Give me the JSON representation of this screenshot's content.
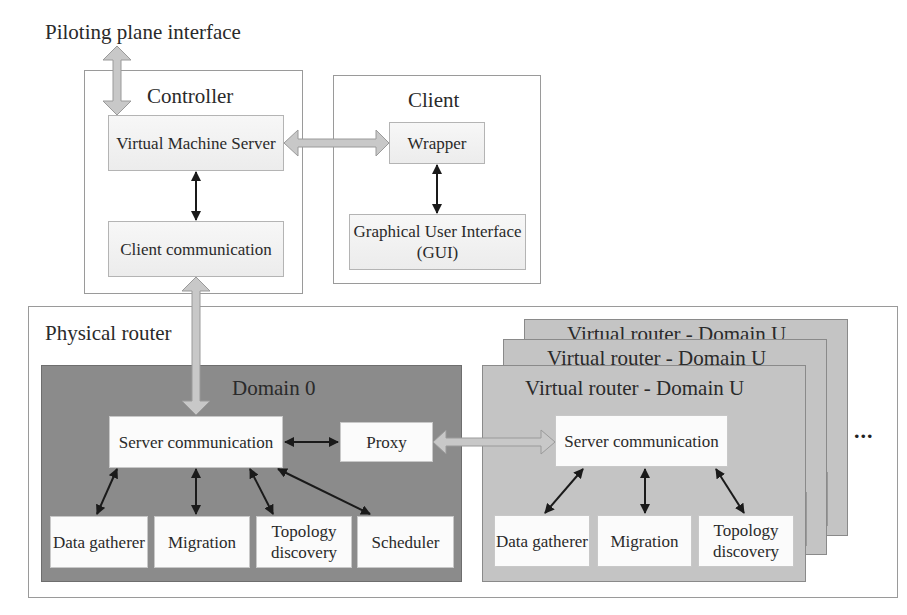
{
  "diagram": {
    "piloting_label": "Piloting plane interface",
    "controller": {
      "title": "Controller",
      "vm_server": "Virtual Machine Server",
      "client_comm": "Client communication"
    },
    "client": {
      "title": "Client",
      "wrapper": "Wrapper",
      "gui": "Graphical User Interface (GUI)"
    },
    "physical_router": {
      "title": "Physical router",
      "domain0": {
        "title": "Domain 0",
        "server_comm": "Server communication",
        "proxy": "Proxy",
        "modules": [
          "Data gatherer",
          "Migration",
          "Topology discovery",
          "Scheduler"
        ]
      },
      "virtual_router": {
        "title": "Virtual router - Domain U",
        "server_comm": "Server communication",
        "modules": [
          "Data gatherer",
          "Migration",
          "Topology discovery"
        ]
      },
      "ellipsis": "..."
    },
    "colors": {
      "domain0_bg": "#8b8b8b",
      "domainU_bg": "#c4c4c4",
      "wide_arrow": "#c8c8c8",
      "thin_arrow": "#1a1a1a"
    }
  }
}
